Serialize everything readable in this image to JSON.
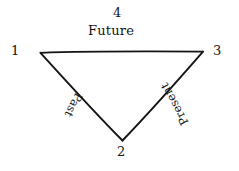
{
  "figure": {
    "background_color": "#ffffff",
    "ink_color": "#141414",
    "shape": "downward-pointing triangle",
    "vertices": [
      {
        "id": "1",
        "label": "1",
        "position": "left",
        "x": 40,
        "y": 52
      },
      {
        "id": "3",
        "label": "3",
        "position": "right",
        "x": 203,
        "y": 52
      },
      {
        "id": "2",
        "label": "2",
        "position": "bottom",
        "x": 122,
        "y": 140
      }
    ],
    "edges": [
      {
        "id": "top",
        "label": "Future",
        "number": "4",
        "from": "1",
        "to": "3",
        "rotation_deg": 0
      },
      {
        "id": "left",
        "label": "Past",
        "number": "",
        "from": "1",
        "to": "2",
        "rotation_deg": 118
      },
      {
        "id": "right",
        "label": "Present",
        "number": "",
        "from": "2",
        "to": "3",
        "rotation_deg": -118
      }
    ],
    "line_style": "hand-drawn thin stroke"
  },
  "labels": {
    "vertex_1": "1",
    "vertex_2": "2",
    "vertex_3": "3",
    "top_number": "4",
    "top_word": "Future",
    "left_word": "Past",
    "right_word": "Present"
  }
}
